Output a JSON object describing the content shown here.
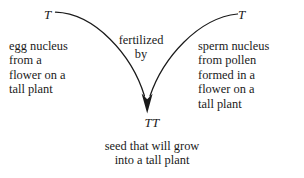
{
  "figure": {
    "background_color": "#ffffff",
    "ink_color": "#1a1a1a",
    "width": 304,
    "height": 178
  },
  "alleles": {
    "left": "T",
    "right": "T",
    "zygote": "TT"
  },
  "captions": {
    "egg": "egg nucleus\nfrom a\nflower on a\ntall plant",
    "fertilization": "fertilized\nby",
    "sperm": "sperm nucleus\nfrom pollen\nformed in a\nflower on a\ntall plant",
    "seed": "seed that will grow\ninto a tall plant"
  },
  "arrows": [
    {
      "name": "egg-to-zygote-arrow",
      "from": "left T",
      "to": "zygote TT",
      "style": "curved, arrowhead at bottom"
    },
    {
      "name": "sperm-to-zygote-arrow",
      "from": "right T",
      "to": "zygote TT",
      "style": "curved, arrowhead at bottom"
    }
  ]
}
